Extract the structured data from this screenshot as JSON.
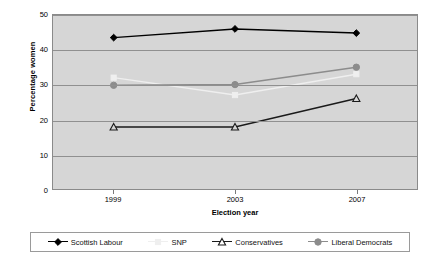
{
  "chart_data": {
    "type": "line",
    "title": "",
    "xlabel": "Election year",
    "ylabel": "Percentage women",
    "categories": [
      "1999",
      "2003",
      "2007"
    ],
    "x": [
      1999,
      2003,
      2007
    ],
    "ylim": [
      0,
      50
    ],
    "yticks": [
      0,
      10,
      20,
      30,
      40,
      50
    ],
    "grid": true,
    "legend_position": "bottom",
    "plot_background": "#d6d6d6",
    "series": [
      {
        "name": "Scottish Labour",
        "values": [
          43.5,
          46.0,
          44.8
        ],
        "color": "#000000",
        "marker": "diamond-filled"
      },
      {
        "name": "SNP",
        "values": [
          32.0,
          27.0,
          33.0
        ],
        "color": "#efefef",
        "marker": "square-filled"
      },
      {
        "name": "Conservatives",
        "values": [
          17.8,
          17.8,
          26.0
        ],
        "color": "#1a1a1a",
        "marker": "triangle-open"
      },
      {
        "name": "Liberal Democrats",
        "values": [
          29.8,
          30.0,
          35.0
        ],
        "color": "#8c8c8c",
        "marker": "circle-filled"
      }
    ]
  },
  "axes": {
    "ytick_labels": [
      "50",
      "40",
      "30",
      "20",
      "10",
      "0"
    ],
    "xtick_labels": [
      "1999",
      "2003",
      "2007"
    ],
    "x_title": "Election year",
    "y_title": "Percentage women"
  },
  "legend": {
    "items": [
      {
        "label": "Scottish Labour"
      },
      {
        "label": "SNP"
      },
      {
        "label": "Conservatives"
      },
      {
        "label": "Liberal Democrats"
      }
    ]
  }
}
